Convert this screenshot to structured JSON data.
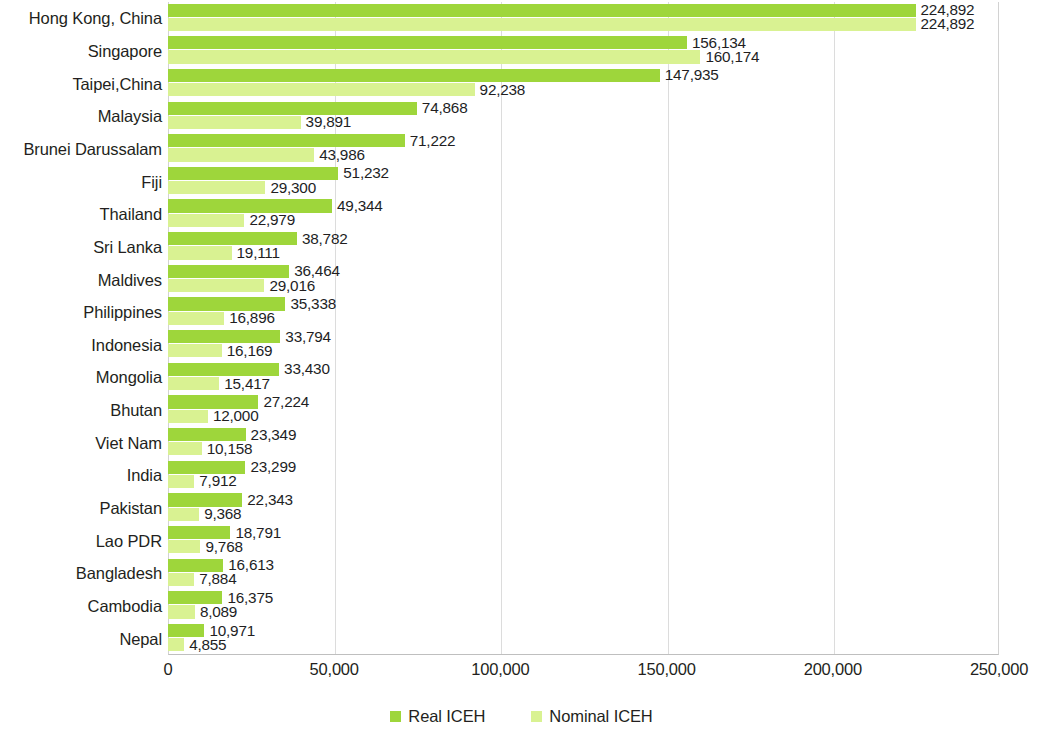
{
  "chart_data": {
    "type": "bar",
    "orientation": "horizontal",
    "title": "",
    "xlabel": "",
    "ylabel": "",
    "xlim": [
      0,
      250000
    ],
    "xticks": [
      "0",
      "50,000",
      "100,000",
      "150,000",
      "200,000",
      "250,000"
    ],
    "xtick_values": [
      0,
      50000,
      100000,
      150000,
      200000,
      250000
    ],
    "grid": true,
    "grid_axis": "x",
    "legend_position": "bottom",
    "categories": [
      "Hong Kong, China",
      "Singapore",
      "Taipei,China",
      "Malaysia",
      "Brunei Darussalam",
      "Fiji",
      "Thailand",
      "Sri Lanka",
      "Maldives",
      "Philippines",
      "Indonesia",
      "Mongolia",
      "Bhutan",
      "Viet Nam",
      "India",
      "Pakistan",
      "Lao PDR",
      "Bangladesh",
      "Cambodia",
      "Nepal"
    ],
    "series": [
      {
        "name": "Real ICEH",
        "color": "#9ed63b",
        "values": [
          224892,
          156134,
          147935,
          74868,
          71222,
          51232,
          49344,
          38782,
          36464,
          35338,
          33794,
          33430,
          27224,
          23349,
          23299,
          22343,
          18791,
          16613,
          16375,
          10971
        ],
        "labels": [
          "224,892",
          "156,134",
          "147,935",
          "74,868",
          "71,222",
          "51,232",
          "49,344",
          "38,782",
          "36,464",
          "35,338",
          "33,794",
          "33,430",
          "27,224",
          "23,349",
          "23,299",
          "22,343",
          "18,791",
          "16,613",
          "16,375",
          "10,971"
        ]
      },
      {
        "name": "Nominal ICEH",
        "color": "#d9f292",
        "values": [
          224892,
          160174,
          92238,
          39891,
          43986,
          29300,
          22979,
          19111,
          29016,
          16896,
          16169,
          15417,
          12000,
          10158,
          7912,
          9368,
          9768,
          7884,
          8089,
          4855
        ],
        "labels": [
          "224,892",
          "160,174",
          "92,238",
          "39,891",
          "43,986",
          "29,300",
          "22,979",
          "19,111",
          "29,016",
          "16,896",
          "16,169",
          "15,417",
          "12,000",
          "10,158",
          "7,912",
          "9,368",
          "9,768",
          "7,884",
          "8,089",
          "4,855"
        ]
      }
    ]
  },
  "legend": {
    "items": [
      {
        "label": "Real ICEH",
        "color": "#9ed63b"
      },
      {
        "label": "Nominal ICEH",
        "color": "#d9f292"
      }
    ]
  }
}
